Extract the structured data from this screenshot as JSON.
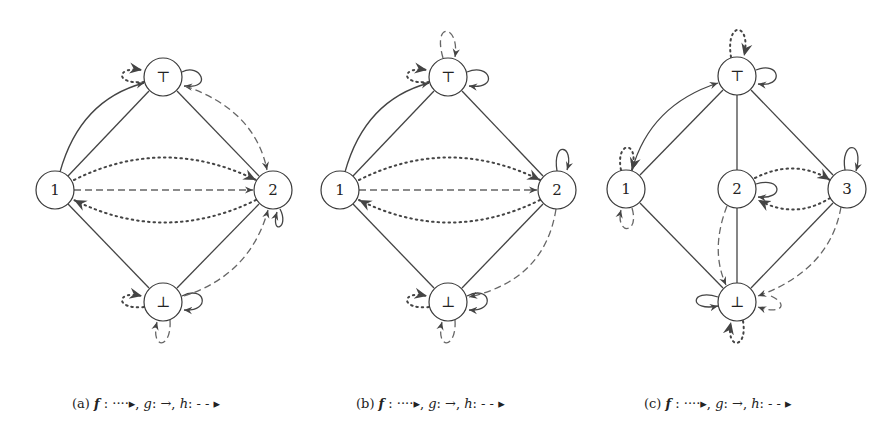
{
  "figure": {
    "panels": [
      {
        "id": "a",
        "caption": {
          "tag": "(a)",
          "f": "f",
          "f_sym": " : ····▸,",
          "g": " g",
          "g_sym": ": →,",
          "h": " h",
          "h_sym": ": - - ▸"
        },
        "nodes": [
          {
            "id": "top",
            "label": "⊤",
            "x": 163,
            "y": 77
          },
          {
            "id": "1",
            "label": "1",
            "x": 55,
            "y": 190
          },
          {
            "id": "2",
            "label": "2",
            "x": 273,
            "y": 190
          },
          {
            "id": "bot",
            "label": "⊥",
            "x": 163,
            "y": 302
          }
        ],
        "lattice_edges": [
          [
            "1",
            "top"
          ],
          [
            "top",
            "2"
          ],
          [
            "1",
            "bot"
          ],
          [
            "2",
            "bot"
          ]
        ],
        "function_edges": {
          "f": [
            [
              "1",
              "2"
            ],
            [
              "2",
              "1"
            ],
            [
              "top",
              "top"
            ],
            [
              "bot",
              "bot"
            ]
          ],
          "g": [
            [
              "1",
              "top"
            ],
            [
              "top",
              "top"
            ],
            [
              "2",
              "2"
            ],
            [
              "bot",
              "bot"
            ]
          ],
          "h": [
            [
              "1",
              "2"
            ],
            [
              "top",
              "2"
            ],
            [
              "bot",
              "2"
            ],
            [
              "2",
              "bot"
            ],
            [
              "bot",
              "bot"
            ]
          ]
        }
      },
      {
        "id": "b",
        "caption": {
          "tag": "(b)",
          "f": "f",
          "f_sym": " : ····▸,",
          "g": " g",
          "g_sym": ": →,",
          "h": " h",
          "h_sym": ": - - ▸"
        },
        "nodes": [
          {
            "id": "top",
            "label": "⊤",
            "x": 448,
            "y": 77
          },
          {
            "id": "1",
            "label": "1",
            "x": 340,
            "y": 190
          },
          {
            "id": "2",
            "label": "2",
            "x": 557,
            "y": 190
          },
          {
            "id": "bot",
            "label": "⊥",
            "x": 448,
            "y": 302
          }
        ],
        "lattice_edges": [
          [
            "1",
            "top"
          ],
          [
            "top",
            "2"
          ],
          [
            "1",
            "bot"
          ],
          [
            "2",
            "bot"
          ]
        ],
        "function_edges": {
          "f": [
            [
              "1",
              "2"
            ],
            [
              "2",
              "1"
            ],
            [
              "top",
              "top"
            ],
            [
              "bot",
              "bot"
            ]
          ],
          "g": [
            [
              "1",
              "top"
            ],
            [
              "top",
              "top"
            ],
            [
              "2",
              "2"
            ],
            [
              "bot",
              "bot"
            ]
          ],
          "h": [
            [
              "1",
              "2"
            ],
            [
              "top",
              "top"
            ],
            [
              "2",
              "bot"
            ],
            [
              "bot",
              "bot"
            ]
          ]
        }
      },
      {
        "id": "c",
        "caption": {
          "tag": "(c)",
          "f": "f",
          "f_sym": " : ····▸,",
          "g": " g",
          "g_sym": ": →,",
          "h": " h",
          "h_sym": ": - - ▸"
        },
        "nodes": [
          {
            "id": "top",
            "label": "⊤",
            "x": 737,
            "y": 76
          },
          {
            "id": "1",
            "label": "1",
            "x": 626,
            "y": 189
          },
          {
            "id": "2",
            "label": "2",
            "x": 737,
            "y": 189
          },
          {
            "id": "3",
            "label": "3",
            "x": 847,
            "y": 189
          },
          {
            "id": "bot",
            "label": "⊥",
            "x": 737,
            "y": 302
          }
        ],
        "lattice_edges": [
          [
            "1",
            "top"
          ],
          [
            "top",
            "2"
          ],
          [
            "top",
            "3"
          ],
          [
            "1",
            "bot"
          ],
          [
            "2",
            "bot"
          ],
          [
            "3",
            "bot"
          ]
        ],
        "function_edges": {
          "f": [
            [
              "1",
              "1"
            ],
            [
              "top",
              "top"
            ],
            [
              "2",
              "3"
            ],
            [
              "3",
              "2"
            ],
            [
              "bot",
              "bot"
            ]
          ],
          "g": [
            [
              "1",
              "top"
            ],
            [
              "top",
              "1"
            ],
            [
              "top",
              "top"
            ],
            [
              "2",
              "2"
            ],
            [
              "3",
              "3"
            ],
            [
              "bot",
              "bot"
            ]
          ],
          "h": [
            [
              "1",
              "1"
            ],
            [
              "2",
              "bot"
            ],
            [
              "3",
              "bot"
            ],
            [
              "bot",
              "bot"
            ]
          ]
        }
      }
    ]
  }
}
